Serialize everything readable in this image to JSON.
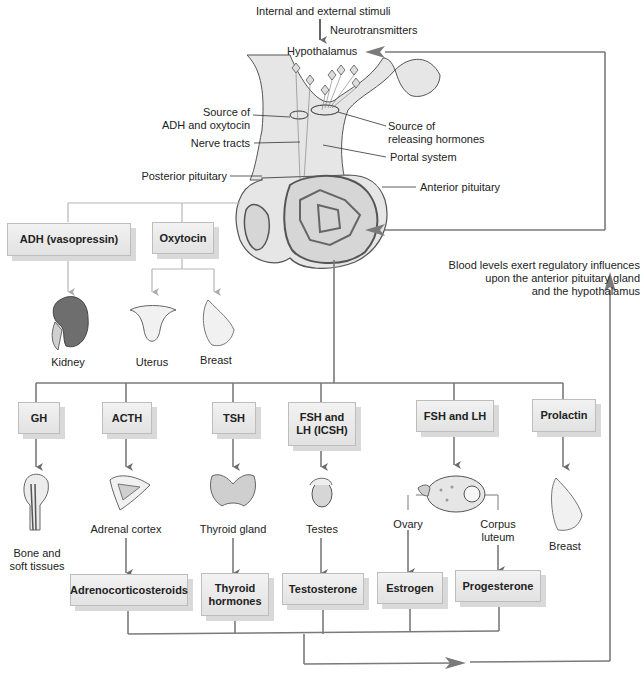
{
  "top": {
    "stimuli": "Internal and external stimuli",
    "neurotransmitters": "Neurotransmitters",
    "hypothalamus": "Hypothalamus"
  },
  "labels": {
    "source_adh_1": "Source of",
    "source_adh_2": "ADH and oxytocin",
    "nerve_tracts": "Nerve tracts",
    "posterior_pituitary": "Posterior pituitary",
    "source_rel_1": "Source of",
    "source_rel_2": "releasing hormones",
    "portal_system": "Portal system",
    "anterior_pituitary": "Anterior pituitary"
  },
  "feedback": {
    "line1": "Blood levels exert regulatory influences",
    "line2": "upon the anterior pituitary gland",
    "line3": "and the hypothalamus"
  },
  "posterior_hormones": [
    {
      "label": "ADH (vasopressin)",
      "targets": [
        "Kidney"
      ]
    },
    {
      "label": "Oxytocin",
      "targets": [
        "Uterus",
        "Breast"
      ]
    }
  ],
  "anterior_hormones": [
    {
      "label": "GH",
      "target": "Bone and soft tissues"
    },
    {
      "label": "ACTH",
      "target": "Adrenal cortex",
      "product": "Adrenocorticosteroids"
    },
    {
      "label": "TSH",
      "target": "Thyroid gland",
      "product": "Thyroid hormones"
    },
    {
      "label": "FSH and LH (ICSH)",
      "target": "Testes",
      "product": "Testosterone"
    },
    {
      "label": "FSH and LH",
      "targets": [
        "Ovary",
        "Corpus luteum"
      ],
      "products": [
        "Estrogen",
        "Progesterone"
      ]
    },
    {
      "label": "Prolactin",
      "target": "Breast"
    }
  ],
  "text": {
    "kidney": "Kidney",
    "uterus": "Uterus",
    "breast1": "Breast",
    "bone1": "Bone and",
    "bone2": "soft tissues",
    "adrenal": "Adrenal cortex",
    "thyroid": "Thyroid gland",
    "testes": "Testes",
    "ovary": "Ovary",
    "corpus1": "Corpus",
    "corpus2": "luteum",
    "breast2": "Breast",
    "adh_box": "ADH (vasopressin)",
    "oxy_box": "Oxytocin",
    "gh_box": "GH",
    "acth_box": "ACTH",
    "tsh_box": "TSH",
    "fshlh_icsh_1": "FSH and",
    "fshlh_icsh_2": "LH (ICSH)",
    "fshlh_box": "FSH and LH",
    "prolactin_box": "Prolactin",
    "adreno_box": "Adrenocorticosteroids",
    "thyroid_h1": "Thyroid",
    "thyroid_h2": "hormones",
    "testo_box": "Testosterone",
    "estrogen_box": "Estrogen",
    "progesterone_box": "Progesterone"
  },
  "colors": {
    "line": "#7a7a7a",
    "light_line": "#b5b5b5",
    "box_bg": "#e8e8e8"
  }
}
